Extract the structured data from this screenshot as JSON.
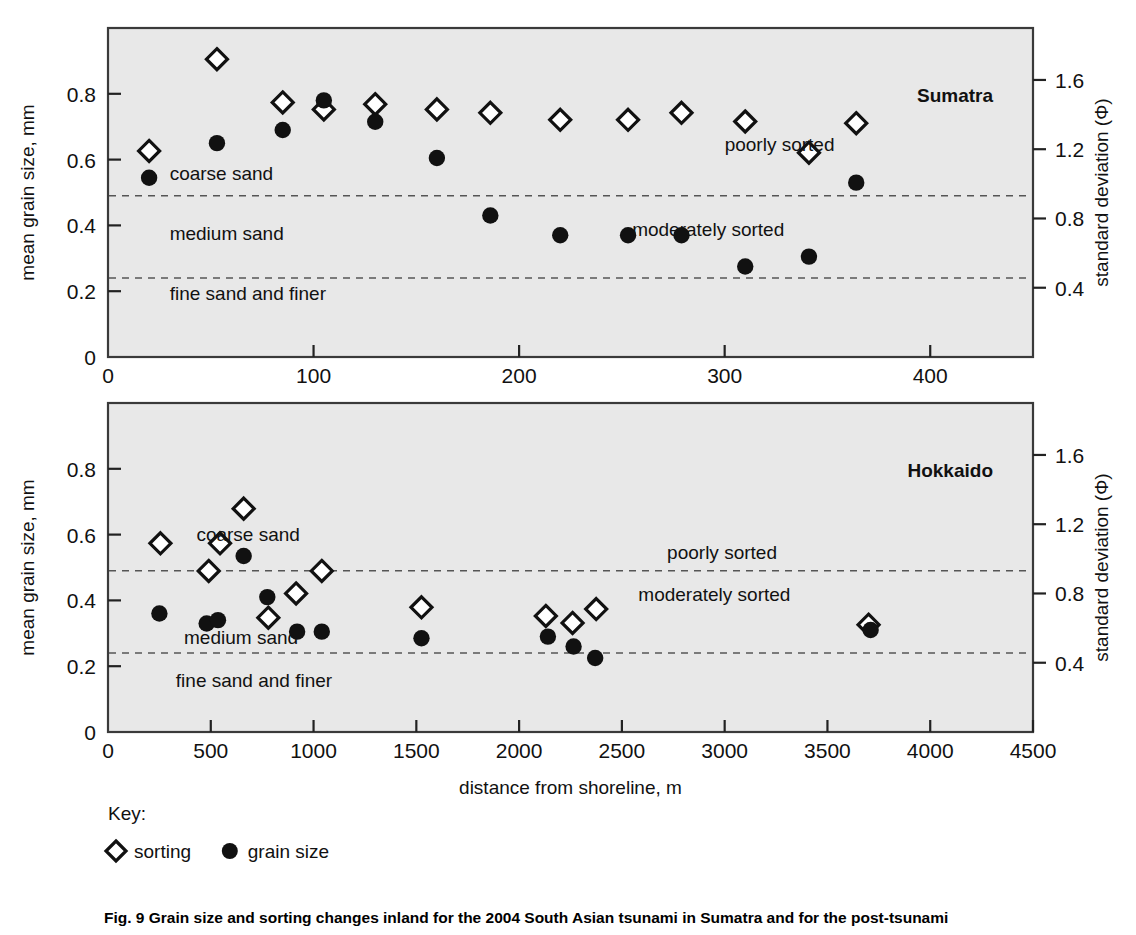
{
  "figure": {
    "caption": "Fig. 9  Grain size and sorting changes inland for the 2004 South Asian tsunami in Sumatra and for the post-tsunami"
  },
  "key": {
    "title": "Key:",
    "items": [
      {
        "marker": "diamond-open",
        "label": "sorting"
      },
      {
        "marker": "circle-filled",
        "label": "grain size"
      }
    ]
  },
  "axes": {
    "x_title": "distance from shoreline, m",
    "y_left_title": "mean grain size, mm",
    "y_right_title": "standard deviation (Φ)"
  },
  "colors": {
    "plot_background": "#e8e8e8",
    "frame": "#3a3a3a",
    "marker_fill": "#111111",
    "marker_open": "#ffffff",
    "dashed_line": "#555555"
  },
  "chart_data": [
    {
      "type": "scatter",
      "title": "Sumatra",
      "panel_label": "Sumatra",
      "xlabel": "distance from shoreline, m",
      "ylabel": "mean grain size, mm",
      "y2label": "standard deviation (Φ)",
      "xlim": [
        0,
        450
      ],
      "ylim": [
        0,
        1.0
      ],
      "y2lim": [
        0.0,
        1.9
      ],
      "xticks": [
        0,
        100,
        200,
        300,
        400
      ],
      "xticklabels": [
        "0",
        "100",
        "200",
        "300",
        "400"
      ],
      "yticks": [
        0,
        0.2,
        0.4,
        0.6,
        0.8
      ],
      "yticklabels": [
        "0",
        "0.2",
        "0.4",
        "0.6",
        "0.8"
      ],
      "y2ticks": [
        0.4,
        0.8,
        1.2,
        1.6
      ],
      "y2ticklabels": [
        "0.4",
        "0.8",
        "1.2",
        "1.6"
      ],
      "grid": false,
      "legend_position": "below-figure",
      "hlines": [
        {
          "y": 0.49,
          "style": "dashed"
        },
        {
          "y": 0.24,
          "style": "dashed"
        }
      ],
      "annotations": [
        {
          "text": "coarse sand",
          "x": 30,
          "y": 0.555,
          "align": "left"
        },
        {
          "text": "medium sand",
          "x": 30,
          "y": 0.375,
          "align": "left"
        },
        {
          "text": "fine sand and finer",
          "x": 30,
          "y": 0.19,
          "align": "left"
        },
        {
          "text": "poorly sorted",
          "x": 300,
          "y": 0.645,
          "align": "left"
        },
        {
          "text": "moderately sorted",
          "x": 255,
          "y": 0.385,
          "align": "left"
        }
      ],
      "series": [
        {
          "name": "sorting",
          "marker": "diamond-open",
          "axis": "right",
          "points": [
            {
              "x": 20,
              "y2": 1.19
            },
            {
              "x": 53,
              "y2": 1.72
            },
            {
              "x": 85,
              "y2": 1.47
            },
            {
              "x": 105,
              "y2": 1.43
            },
            {
              "x": 130,
              "y2": 1.46
            },
            {
              "x": 160,
              "y2": 1.43
            },
            {
              "x": 186,
              "y2": 1.41
            },
            {
              "x": 220,
              "y2": 1.37
            },
            {
              "x": 253,
              "y2": 1.37
            },
            {
              "x": 279,
              "y2": 1.41
            },
            {
              "x": 310,
              "y2": 1.36
            },
            {
              "x": 341,
              "y2": 1.18
            },
            {
              "x": 364,
              "y2": 1.35
            }
          ]
        },
        {
          "name": "grain size",
          "marker": "circle-filled",
          "axis": "left",
          "points": [
            {
              "x": 20,
              "y": 0.545
            },
            {
              "x": 53,
              "y": 0.65
            },
            {
              "x": 85,
              "y": 0.69
            },
            {
              "x": 105,
              "y": 0.78
            },
            {
              "x": 130,
              "y": 0.715
            },
            {
              "x": 160,
              "y": 0.605
            },
            {
              "x": 186,
              "y": 0.43
            },
            {
              "x": 220,
              "y": 0.37
            },
            {
              "x": 253,
              "y": 0.37
            },
            {
              "x": 279,
              "y": 0.37
            },
            {
              "x": 310,
              "y": 0.275
            },
            {
              "x": 341,
              "y": 0.305
            },
            {
              "x": 364,
              "y": 0.53
            }
          ]
        }
      ]
    },
    {
      "type": "scatter",
      "title": "Hokkaido",
      "panel_label": "Hokkaido",
      "xlabel": "distance from shoreline, m",
      "ylabel": "mean grain size, mm",
      "y2label": "standard deviation (Φ)",
      "xlim": [
        0,
        4500
      ],
      "ylim": [
        0,
        1.0
      ],
      "y2lim": [
        0.0,
        1.9
      ],
      "xticks": [
        0,
        500,
        1000,
        1500,
        2000,
        2500,
        3000,
        3500,
        4000,
        4500
      ],
      "xticklabels": [
        "0",
        "500",
        "1000",
        "1500",
        "2000",
        "2500",
        "3000",
        "3500",
        "4000",
        "4500"
      ],
      "yticks": [
        0,
        0.2,
        0.4,
        0.6,
        0.8
      ],
      "yticklabels": [
        "0",
        "0.2",
        "0.4",
        "0.6",
        "0.8"
      ],
      "y2ticks": [
        0.4,
        0.8,
        1.2,
        1.6
      ],
      "y2ticklabels": [
        "0.4",
        "0.8",
        "1.2",
        "1.6"
      ],
      "grid": false,
      "legend_position": "below-figure",
      "hlines": [
        {
          "y": 0.49,
          "style": "dashed"
        },
        {
          "y": 0.24,
          "style": "dashed"
        }
      ],
      "annotations": [
        {
          "text": "coarse sand",
          "x": 430,
          "y": 0.6,
          "align": "left"
        },
        {
          "text": "medium sand",
          "x": 370,
          "y": 0.285,
          "align": "left"
        },
        {
          "text": "fine sand and finer",
          "x": 330,
          "y": 0.155,
          "align": "left"
        },
        {
          "text": "poorly sorted",
          "x": 2720,
          "y": 0.545,
          "align": "left"
        },
        {
          "text": "moderately sorted",
          "x": 2580,
          "y": 0.415,
          "align": "left"
        }
      ],
      "series": [
        {
          "name": "sorting",
          "marker": "diamond-open",
          "axis": "right",
          "points": [
            {
              "x": 255,
              "y2": 1.09
            },
            {
              "x": 490,
              "y2": 0.93
            },
            {
              "x": 545,
              "y2": 1.09
            },
            {
              "x": 660,
              "y2": 1.29
            },
            {
              "x": 780,
              "y2": 0.66
            },
            {
              "x": 915,
              "y2": 0.8
            },
            {
              "x": 1040,
              "y2": 0.93
            },
            {
              "x": 1525,
              "y2": 0.72
            },
            {
              "x": 2130,
              "y2": 0.67
            },
            {
              "x": 2260,
              "y2": 0.63
            },
            {
              "x": 2375,
              "y2": 0.71
            },
            {
              "x": 3700,
              "y2": 0.62
            }
          ]
        },
        {
          "name": "grain size",
          "marker": "circle-filled",
          "axis": "left",
          "points": [
            {
              "x": 250,
              "y": 0.36
            },
            {
              "x": 480,
              "y": 0.33
            },
            {
              "x": 535,
              "y": 0.34
            },
            {
              "x": 660,
              "y": 0.535
            },
            {
              "x": 775,
              "y": 0.41
            },
            {
              "x": 920,
              "y": 0.305
            },
            {
              "x": 1040,
              "y": 0.305
            },
            {
              "x": 1525,
              "y": 0.285
            },
            {
              "x": 2140,
              "y": 0.29
            },
            {
              "x": 2265,
              "y": 0.26
            },
            {
              "x": 2370,
              "y": 0.225
            },
            {
              "x": 3710,
              "y": 0.31
            }
          ]
        }
      ]
    }
  ]
}
